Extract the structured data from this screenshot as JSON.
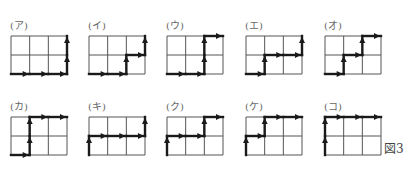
{
  "figure": {
    "caption": "図3",
    "grid": {
      "cols": 3,
      "rows": 2,
      "cell_w": 18.67,
      "cell_h": 19
    },
    "colors": {
      "grid_line": "#555555",
      "path": "#1a1a1a"
    },
    "panels": [
      {
        "label": "(ア)",
        "x": 11,
        "y": 36,
        "moves": [
          "R",
          "R",
          "R",
          "U",
          "U"
        ]
      },
      {
        "label": "(イ)",
        "x": 89,
        "y": 36,
        "moves": [
          "R",
          "R",
          "U",
          "R",
          "U"
        ]
      },
      {
        "label": "(ウ)",
        "x": 167,
        "y": 36,
        "moves": [
          "R",
          "R",
          "U",
          "U",
          "R"
        ]
      },
      {
        "label": "(エ)",
        "x": 246,
        "y": 36,
        "moves": [
          "R",
          "U",
          "R",
          "R",
          "U"
        ]
      },
      {
        "label": "(オ)",
        "x": 325,
        "y": 36,
        "moves": [
          "R",
          "U",
          "R",
          "U",
          "R"
        ]
      },
      {
        "label": "(カ)",
        "x": 11,
        "y": 117,
        "moves": [
          "R",
          "U",
          "U",
          "R",
          "R"
        ]
      },
      {
        "label": "(キ)",
        "x": 89,
        "y": 117,
        "moves": [
          "U",
          "R",
          "R",
          "R",
          "U"
        ]
      },
      {
        "label": "(ク)",
        "x": 167,
        "y": 117,
        "moves": [
          "U",
          "R",
          "R",
          "U",
          "R"
        ]
      },
      {
        "label": "(ケ)",
        "x": 246,
        "y": 117,
        "moves": [
          "U",
          "R",
          "U",
          "R",
          "R"
        ]
      },
      {
        "label": "(コ)",
        "x": 325,
        "y": 117,
        "moves": [
          "U",
          "U",
          "R",
          "R",
          "R"
        ]
      }
    ]
  }
}
